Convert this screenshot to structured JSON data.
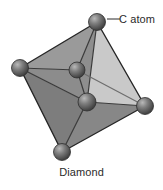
{
  "figure": {
    "name": "diamond-crystal-structure",
    "caption": "Diamond",
    "callout": {
      "label": "C atom",
      "leader_dash": "—"
    },
    "background_color": "#ffffff",
    "text_color": "#2b2b2b"
  },
  "structure": {
    "shape": "octahedron",
    "edge_color": "#2a2a2a",
    "inner_line_color": "#4a4a4a",
    "faces": [
      {
        "name": "upper-left-face",
        "fill": "#9a9a9a",
        "points": "20,68 97,22 77,70"
      },
      {
        "name": "upper-mid-face",
        "fill": "#8e8e8e",
        "points": "97,22 77,70 87,102"
      },
      {
        "name": "upper-right-face",
        "fill": "#c9c9c9",
        "points": "97,22 87,102 145,106"
      },
      {
        "name": "left-face",
        "fill": "#8c8c8c",
        "points": "20,68 77,70 87,102"
      },
      {
        "name": "lower-left-face",
        "fill": "#7d7d7d",
        "points": "20,68 87,102 62,152"
      },
      {
        "name": "lower-right-face",
        "fill": "#878787",
        "points": "87,102 145,106 62,152"
      }
    ],
    "atoms": [
      {
        "name": "c-atom-top",
        "cx": 97,
        "cy": 22,
        "r": 8.5,
        "label_target": true
      },
      {
        "name": "c-atom-left",
        "cx": 20,
        "cy": 68,
        "r": 8.5,
        "label_target": false
      },
      {
        "name": "c-atom-right",
        "cx": 145,
        "cy": 106,
        "r": 8.5,
        "label_target": false
      },
      {
        "name": "c-atom-bottom",
        "cx": 62,
        "cy": 152,
        "r": 8.5,
        "label_target": false
      },
      {
        "name": "c-atom-center-upper",
        "cx": 77,
        "cy": 70,
        "r": 8.0,
        "label_target": false
      },
      {
        "name": "c-atom-center-lower",
        "cx": 87,
        "cy": 102,
        "r": 9.0,
        "label_target": false
      }
    ],
    "bonds": [
      {
        "name": "bond-top-left",
        "x1": 97,
        "y1": 22,
        "x2": 20,
        "y2": 68
      },
      {
        "name": "bond-top-centerupper",
        "x1": 97,
        "y1": 22,
        "x2": 77,
        "y2": 70
      },
      {
        "name": "bond-top-centerlower",
        "x1": 97,
        "y1": 22,
        "x2": 87,
        "y2": 102
      },
      {
        "name": "bond-top-right",
        "x1": 97,
        "y1": 22,
        "x2": 145,
        "y2": 106
      },
      {
        "name": "bond-left-centerupper",
        "x1": 20,
        "y1": 68,
        "x2": 77,
        "y2": 70
      },
      {
        "name": "bond-left-centerlower",
        "x1": 20,
        "y1": 68,
        "x2": 87,
        "y2": 102
      },
      {
        "name": "bond-left-bottom",
        "x1": 20,
        "y1": 68,
        "x2": 62,
        "y2": 152
      },
      {
        "name": "bond-centerupper-centerlower",
        "x1": 77,
        "y1": 70,
        "x2": 87,
        "y2": 102
      },
      {
        "name": "bond-centerupper-right",
        "x1": 77,
        "y1": 70,
        "x2": 145,
        "y2": 106
      },
      {
        "name": "bond-centerlower-right",
        "x1": 87,
        "y1": 102,
        "x2": 145,
        "y2": 106
      },
      {
        "name": "bond-centerlower-bottom",
        "x1": 87,
        "y1": 102,
        "x2": 62,
        "y2": 152
      },
      {
        "name": "bond-right-bottom",
        "x1": 145,
        "y1": 106,
        "x2": 62,
        "y2": 152
      }
    ],
    "leader_line": {
      "x1": 106,
      "y1": 20,
      "x2": 120,
      "y2": 19
    }
  }
}
